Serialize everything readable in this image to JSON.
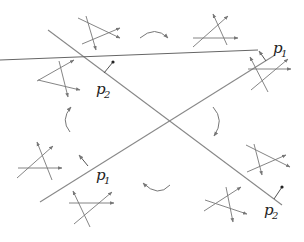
{
  "diagram": {
    "type": "crossing-lines-with-local-moves",
    "colors": {
      "line": "#777777",
      "arrow": "#777777",
      "normal": "#333333",
      "text": "#222222"
    },
    "main_lines": [
      {
        "id": "line-a",
        "from": [
          28,
          185
        ],
        "to": [
          283,
          30
        ],
        "label_top": "p",
        "label_top_sub": "1",
        "label_bottom": "p",
        "label_bottom_sub": "1"
      },
      {
        "id": "line-b",
        "from": [
          50,
          30
        ],
        "to": [
          284,
          217
        ],
        "label_top": "p",
        "label_top_sub": "2",
        "label_bottom": "p",
        "label_bottom_sub": "2"
      }
    ],
    "labels": [
      {
        "name": "label-p1-top-right",
        "text": "p",
        "sub": "1",
        "x": 275,
        "y": 50
      },
      {
        "name": "label-p2-top-left",
        "text": "p",
        "sub": "2",
        "x": 97,
        "y": 95
      },
      {
        "name": "label-p1-bottom-left",
        "text": "p",
        "sub": "1",
        "x": 97,
        "y": 180
      },
      {
        "name": "label-p2-bottom-right",
        "text": "p",
        "sub": "2",
        "x": 264,
        "y": 216
      }
    ],
    "cycle_arrows": [
      {
        "name": "curved-arrow-top",
        "direction": "clockwise"
      },
      {
        "name": "curved-arrow-right",
        "direction": "clockwise"
      },
      {
        "name": "curved-arrow-bottom",
        "direction": "clockwise"
      },
      {
        "name": "curved-arrow-left",
        "direction": "clockwise"
      }
    ],
    "glyph_count": 8
  }
}
